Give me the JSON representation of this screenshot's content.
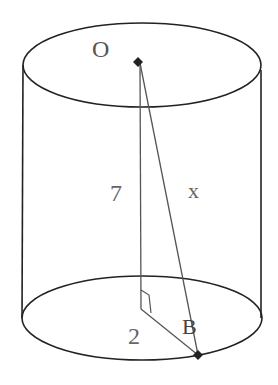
{
  "diagram": {
    "labels": {
      "center_top": "O",
      "height": "7",
      "slant": "x",
      "radius": "2",
      "point_b": "B"
    },
    "colors": {
      "outline": "#222222",
      "inner_lines": "#555555",
      "label": "#666666"
    }
  }
}
